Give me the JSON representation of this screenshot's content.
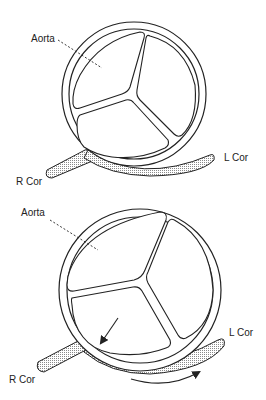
{
  "figure": {
    "panels": [
      {
        "id": "top",
        "labels": {
          "aorta": "Aorta",
          "lcor": "L Cor",
          "rcor": "R Cor"
        }
      },
      {
        "id": "bottom",
        "labels": {
          "aorta": "Aorta",
          "lcor": "L Cor",
          "rcor": "R Cor"
        },
        "arrows": [
          "arrow-into-vessel",
          "arrow-flow-direction"
        ]
      }
    ]
  },
  "colors": {
    "stroke": "#222222",
    "fill": "#ffffff",
    "stipple": "#bdbdbd"
  }
}
